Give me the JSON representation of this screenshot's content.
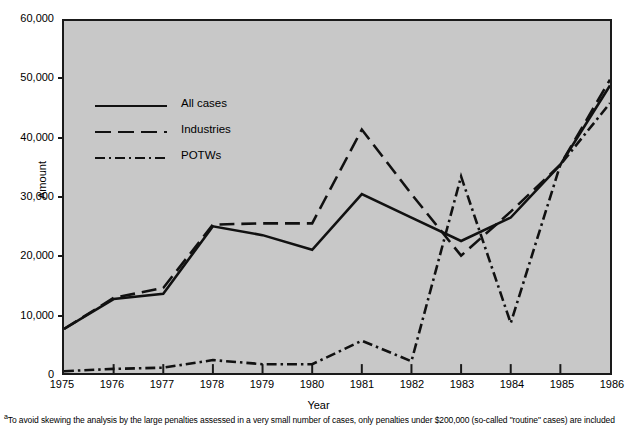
{
  "chart_data": {
    "type": "line",
    "title": "",
    "xlabel": "Year",
    "ylabel": "Amount",
    "categories": [
      1975,
      1976,
      1977,
      1978,
      1979,
      1980,
      1981,
      1982,
      1983,
      1984,
      1985,
      1986
    ],
    "x_tick_labels": [
      "1975",
      "1976",
      "1977",
      "1978",
      "1979",
      "1980",
      "1981",
      "1982",
      "1983",
      "1984",
      "1985",
      "1986"
    ],
    "y_tick_labels": [
      "0",
      "10,000",
      "20,000",
      "30,000",
      "40,000",
      "50,000",
      "60,000"
    ],
    "y_tick_values": [
      0,
      10000,
      20000,
      30000,
      40000,
      50000,
      60000
    ],
    "xlim": [
      1975,
      1986
    ],
    "ylim": [
      0,
      60000
    ],
    "grid": false,
    "legend_position": "upper-left-inside",
    "plot_background": "#c8c8c8",
    "line_color": "#111111",
    "series": [
      {
        "name": "All cases",
        "style": "solid",
        "values": [
          7500,
          12600,
          13500,
          25000,
          23500,
          21000,
          30500,
          26500,
          22500,
          26500,
          35500,
          49000
        ]
      },
      {
        "name": "Industries",
        "style": "dashed",
        "values": [
          7500,
          12800,
          14500,
          25300,
          25500,
          25500,
          41500,
          30500,
          20000,
          27500,
          35500,
          50000
        ]
      },
      {
        "name": "POTWs",
        "style": "dash-dot",
        "values": [
          300,
          700,
          900,
          2200,
          1500,
          1500,
          5500,
          2000,
          33500,
          8500,
          35500,
          46000
        ]
      }
    ]
  },
  "axes": {
    "y_title": "Amount",
    "x_title": "Year"
  },
  "footnote": {
    "marker": "a",
    "text": "To avoid skewing the analysis by the large penalties assessed in a very small number of cases, only penalties under $200,000 (so-called \"routine\" cases) are included"
  }
}
